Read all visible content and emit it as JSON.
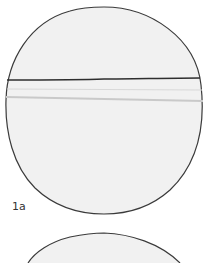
{
  "figure": {
    "label": "1a",
    "colors": {
      "outline": "#3a3a3a",
      "fill": "#f1f1f1",
      "band": "#c9c9c9",
      "background": "#ffffff"
    },
    "shapes": [
      {
        "type": "circle",
        "name": "main-disc",
        "note": "disc with horizontal line and faint bands"
      },
      {
        "type": "circle-partial",
        "name": "second-disc",
        "note": "top edge of second disc, cropped"
      }
    ]
  }
}
